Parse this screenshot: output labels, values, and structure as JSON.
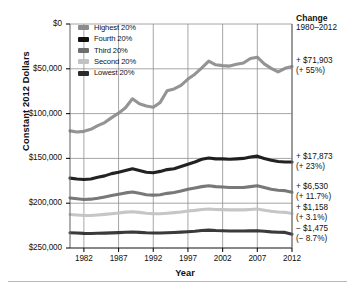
{
  "axes": {
    "ylabel": "Constant 2012 Dollars",
    "xlabel": "Year",
    "yticks": [
      "$250,000",
      "$200,000",
      "$150,000",
      "$100,000",
      "$50,000",
      "$0"
    ],
    "xticks": [
      "1982",
      "1987",
      "1992",
      "1997",
      "2002",
      "2007",
      "2012"
    ]
  },
  "legend": {
    "items": [
      {
        "label": "Highest 20%",
        "color": "#8c8c8c"
      },
      {
        "label": "Fourth 20%",
        "color": "#111111"
      },
      {
        "label": "Third 20%",
        "color": "#6e6e6e"
      },
      {
        "label": "Second 20%",
        "color": "#c2c2c2"
      },
      {
        "label": "Lowest 20%",
        "color": "#2b2b2b"
      }
    ]
  },
  "change_panel": {
    "title": "Change",
    "period": "1980–2012",
    "entries": [
      {
        "amount": "+ $71,903",
        "percent": "(+ 55%)"
      },
      {
        "amount": "+ $17,873",
        "percent": "(+ 23%)"
      },
      {
        "amount": "+ $6,530",
        "percent": "(+ 11.7%)"
      },
      {
        "amount": "+ $1,158",
        "percent": "(+ 3.1%)"
      },
      {
        "amount": "− $1,475",
        "percent": "(− 8.7%)"
      }
    ]
  },
  "chart_data": {
    "type": "line",
    "title": "",
    "xlabel": "Year",
    "ylabel": "Constant 2012 Dollars",
    "xlim": [
      1980,
      2012
    ],
    "ylim": [
      0,
      250000
    ],
    "ytick_values": [
      0,
      50000,
      100000,
      150000,
      200000,
      250000
    ],
    "xtick_values": [
      1982,
      1987,
      1992,
      1997,
      2002,
      2007,
      2012
    ],
    "grid": true,
    "legend_position": "upper-left-inside",
    "x": [
      1980,
      1981,
      1982,
      1983,
      1984,
      1985,
      1986,
      1987,
      1988,
      1989,
      1990,
      1991,
      1992,
      1993,
      1994,
      1995,
      1996,
      1997,
      1998,
      1999,
      2000,
      2001,
      2002,
      2003,
      2004,
      2005,
      2006,
      2007,
      2008,
      2009,
      2010,
      2011,
      2012
    ],
    "series": [
      {
        "name": "Highest 20%",
        "color": "#8c8c8c",
        "values": [
          130700,
          129500,
          130200,
          132500,
          136500,
          140000,
          145500,
          150500,
          156500,
          166500,
          161000,
          158500,
          157000,
          162500,
          175500,
          177500,
          181500,
          188500,
          194000,
          201000,
          208500,
          204500,
          203500,
          203000,
          205000,
          206500,
          211500,
          213000,
          205500,
          200500,
          196500,
          200500,
          202600
        ]
      },
      {
        "name": "Fourth 20%",
        "color": "#111111",
        "values": [
          78000,
          77000,
          76500,
          77000,
          79000,
          80500,
          83000,
          84500,
          86500,
          88500,
          86500,
          84500,
          84000,
          85500,
          87500,
          88500,
          91000,
          93500,
          96000,
          99000,
          100500,
          99500,
          99500,
          99000,
          99500,
          100000,
          101500,
          102500,
          100000,
          98000,
          96500,
          96000,
          95900
        ]
      },
      {
        "name": "Third 20%",
        "color": "#6e6e6e",
        "values": [
          55800,
          55000,
          54200,
          54500,
          55500,
          57000,
          58500,
          60000,
          61500,
          62500,
          61000,
          59500,
          59000,
          59500,
          61000,
          62000,
          63500,
          65500,
          67000,
          68500,
          69500,
          68500,
          68000,
          67500,
          67500,
          67500,
          68500,
          69500,
          67500,
          65500,
          64500,
          64000,
          62300
        ]
      },
      {
        "name": "Second 20%",
        "color": "#c2c2c2",
        "values": [
          37400,
          36800,
          36200,
          36200,
          36800,
          37500,
          38200,
          39000,
          40000,
          40500,
          39800,
          38800,
          38300,
          38200,
          38800,
          39500,
          40200,
          41200,
          42000,
          43000,
          43500,
          43000,
          42800,
          42500,
          42500,
          42500,
          43000,
          43500,
          42200,
          41000,
          40200,
          39800,
          38600
        ]
      },
      {
        "name": "Lowest 20%",
        "color": "#2b2b2b",
        "values": [
          16950,
          16700,
          16300,
          16200,
          16400,
          16600,
          16900,
          17200,
          17500,
          17800,
          17400,
          17000,
          16800,
          16700,
          17000,
          17300,
          17700,
          18200,
          18700,
          19500,
          20000,
          19500,
          19200,
          19000,
          18900,
          18900,
          19100,
          19300,
          18600,
          18000,
          17600,
          17400,
          15475
        ]
      }
    ],
    "annotations": [
      {
        "series": "Highest 20%",
        "amount": "+ $71,903",
        "percent": "(+ 55%)"
      },
      {
        "series": "Fourth 20%",
        "amount": "+ $17,873",
        "percent": "(+ 23%)"
      },
      {
        "series": "Third 20%",
        "amount": "+ $6,530",
        "percent": "(+ 11.7%)"
      },
      {
        "series": "Second 20%",
        "amount": "+ $1,158",
        "percent": "(+ 3.1%)"
      },
      {
        "series": "Lowest 20%",
        "amount": "− $1,475",
        "percent": "(− 8.7%)"
      }
    ]
  }
}
